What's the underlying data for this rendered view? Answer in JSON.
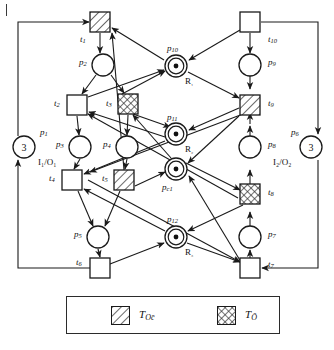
{
  "figure": {
    "type": "petri-net",
    "title": "",
    "background": "#ffffff",
    "line_color": "#1a1a1a"
  },
  "legend": {
    "items": [
      {
        "id": "t-oc",
        "label": "T",
        "sub": "Oc̄",
        "fill": "hatch-diagonal",
        "swatch_x": 44,
        "swatch_y": 9
      },
      {
        "id": "t-o",
        "label": "T",
        "sub": "Ō",
        "fill": "hatch-cross",
        "swatch_x": 150,
        "swatch_y": 9
      }
    ]
  },
  "places": [
    {
      "id": "p1",
      "label": "p",
      "sub": "1",
      "cx": 24,
      "cy": 147,
      "r": 11,
      "token_text": "3",
      "token_dot": false,
      "res": "",
      "lx": 40,
      "ly": 128,
      "io": "I₁/O₁",
      "io_x": 38,
      "io_y": 158
    },
    {
      "id": "p2",
      "label": "p",
      "sub": "2",
      "cx": 103,
      "cy": 65,
      "r": 11,
      "token_text": "",
      "token_dot": false,
      "res": "",
      "lx": 79,
      "ly": 58,
      "io": "",
      "io_x": 0,
      "io_y": 0
    },
    {
      "id": "p3",
      "label": "p",
      "sub": "3",
      "cx": 80,
      "cy": 147,
      "r": 11,
      "token_text": "",
      "token_dot": false,
      "res": "",
      "lx": 56,
      "ly": 140,
      "io": "",
      "io_x": 0,
      "io_y": 0
    },
    {
      "id": "p4",
      "label": "p",
      "sub": "4",
      "cx": 127,
      "cy": 147,
      "r": 11,
      "token_text": "",
      "token_dot": false,
      "res": "",
      "lx": 103,
      "ly": 140,
      "io": "",
      "io_x": 0,
      "io_y": 0
    },
    {
      "id": "p5",
      "label": "p",
      "sub": "5",
      "cx": 98,
      "cy": 237,
      "r": 11,
      "token_text": "",
      "token_dot": false,
      "res": "",
      "lx": 74,
      "ly": 230,
      "io": "",
      "io_x": 0,
      "io_y": 0
    },
    {
      "id": "p6",
      "label": "p",
      "sub": "6",
      "cx": 311,
      "cy": 147,
      "r": 11,
      "token_text": "3",
      "token_dot": false,
      "res": "",
      "lx": 291,
      "ly": 128,
      "io": "I₂/O₂",
      "io_x": 273,
      "io_y": 158
    },
    {
      "id": "p7",
      "label": "p",
      "sub": "7",
      "cx": 250,
      "cy": 237,
      "r": 11,
      "token_text": "",
      "token_dot": false,
      "res": "",
      "lx": 268,
      "ly": 230,
      "io": "",
      "io_x": 0,
      "io_y": 0
    },
    {
      "id": "p8",
      "label": "p",
      "sub": "8",
      "cx": 250,
      "cy": 147,
      "r": 11,
      "token_text": "",
      "token_dot": false,
      "res": "",
      "lx": 268,
      "ly": 140,
      "io": "",
      "io_x": 0,
      "io_y": 0
    },
    {
      "id": "p9",
      "label": "p",
      "sub": "9",
      "cx": 250,
      "cy": 65,
      "r": 11,
      "token_text": "",
      "token_dot": false,
      "res": "",
      "lx": 268,
      "ly": 58,
      "io": "",
      "io_x": 0,
      "io_y": 0
    },
    {
      "id": "p10",
      "label": "p",
      "sub": "10",
      "cx": 176,
      "cy": 66,
      "r": 11,
      "token_text": "",
      "token_dot": true,
      "res": "R₁",
      "lx": 167,
      "ly": 44,
      "io": "",
      "io_x": 0,
      "io_y": 0
    },
    {
      "id": "p11",
      "label": "p",
      "sub": "11",
      "cx": 176,
      "cy": 134,
      "r": 11,
      "token_text": "",
      "token_dot": true,
      "res": "R₂",
      "lx": 167,
      "ly": 113,
      "io": "",
      "io_x": 0,
      "io_y": 0
    },
    {
      "id": "pc1",
      "label": "p",
      "sub": "c1",
      "cx": 176,
      "cy": 169,
      "r": 11,
      "token_text": "",
      "token_dot": true,
      "res": "",
      "lx": 162,
      "ly": 183,
      "io": "",
      "io_x": 0,
      "io_y": 0
    },
    {
      "id": "p12",
      "label": "p",
      "sub": "12",
      "cx": 176,
      "cy": 237,
      "r": 11,
      "token_text": "",
      "token_dot": true,
      "res": "R₃",
      "lx": 167,
      "ly": 215,
      "io": "",
      "io_x": 0,
      "io_y": 0
    }
  ],
  "resource_label_offsets": {
    "dx": 9,
    "dy": 11
  },
  "transitions": [
    {
      "id": "t1",
      "label": "t",
      "sub": "1",
      "cx": 100,
      "cy": 22,
      "size": 20,
      "fill": "hatch-diagonal",
      "lx": 80,
      "ly": 35
    },
    {
      "id": "t2",
      "label": "t",
      "sub": "2",
      "cx": 77,
      "cy": 105,
      "size": 20,
      "fill": "none",
      "lx": 54,
      "ly": 99
    },
    {
      "id": "t3",
      "label": "t",
      "sub": "3",
      "cx": 128,
      "cy": 104,
      "size": 20,
      "fill": "hatch-cross",
      "lx": 106,
      "ly": 99
    },
    {
      "id": "t4",
      "label": "t",
      "sub": "4",
      "cx": 72,
      "cy": 180,
      "size": 20,
      "fill": "none",
      "lx": 49,
      "ly": 174
    },
    {
      "id": "t5",
      "label": "t",
      "sub": "5",
      "cx": 124,
      "cy": 180,
      "size": 20,
      "fill": "hatch-diagonal",
      "lx": 102,
      "ly": 174
    },
    {
      "id": "t6",
      "label": "t",
      "sub": "6",
      "cx": 100,
      "cy": 268,
      "size": 20,
      "fill": "none",
      "lx": 76,
      "ly": 258
    },
    {
      "id": "t7",
      "label": "t",
      "sub": "7",
      "cx": 250,
      "cy": 268,
      "size": 20,
      "fill": "none",
      "lx": 268,
      "ly": 260
    },
    {
      "id": "t8",
      "label": "t",
      "sub": "8",
      "cx": 250,
      "cy": 194,
      "size": 20,
      "fill": "hatch-cross",
      "lx": 268,
      "ly": 188
    },
    {
      "id": "t9",
      "label": "t",
      "sub": "9",
      "cx": 250,
      "cy": 105,
      "size": 20,
      "fill": "hatch-diagonal",
      "lx": 268,
      "ly": 99
    },
    {
      "id": "t10",
      "label": "t",
      "sub": "10",
      "cx": 250,
      "cy": 22,
      "size": 20,
      "fill": "none",
      "lx": 268,
      "ly": 35
    }
  ],
  "chart_data": {
    "type": "diagram",
    "arcs": [
      [
        "p1",
        "t1"
      ],
      [
        "t1",
        "p2"
      ],
      [
        "p2",
        "t2"
      ],
      [
        "p2",
        "t3"
      ],
      [
        "t2",
        "p3"
      ],
      [
        "p3",
        "t4"
      ],
      [
        "t3",
        "p4"
      ],
      [
        "p4",
        "t5"
      ],
      [
        "t4",
        "p5"
      ],
      [
        "t5",
        "p5"
      ],
      [
        "p5",
        "t6"
      ],
      [
        "t6",
        "p1"
      ],
      [
        "p6",
        "t10"
      ],
      [
        "t10",
        "p9"
      ],
      [
        "p9",
        "t9"
      ],
      [
        "t9",
        "p8"
      ],
      [
        "p8",
        "t8"
      ],
      [
        "t8",
        "p7"
      ],
      [
        "p7",
        "t7"
      ],
      [
        "t7",
        "p6"
      ],
      [
        "p10",
        "t2"
      ],
      [
        "p10",
        "t9"
      ],
      [
        "t1",
        "p10"
      ],
      [
        "t10",
        "p10"
      ],
      [
        "p11",
        "t2"
      ],
      [
        "p11",
        "t4"
      ],
      [
        "t3",
        "p11"
      ],
      [
        "t9",
        "p11"
      ],
      [
        "p12",
        "t4"
      ],
      [
        "p12",
        "t7"
      ],
      [
        "t6",
        "p12"
      ],
      [
        "t8",
        "p12"
      ],
      [
        "pc1",
        "t3"
      ],
      [
        "pc1",
        "t8"
      ],
      [
        "t5",
        "pc1"
      ],
      [
        "t7",
        "pc1"
      ]
    ]
  }
}
